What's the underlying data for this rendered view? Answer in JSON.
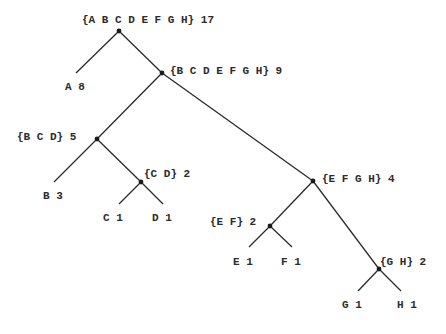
{
  "diagram": {
    "type": "huffman-tree",
    "nodes": [
      {
        "id": "ABCDEFGH",
        "label": "{A B C D E F G H} 17",
        "set": [
          "A",
          "B",
          "C",
          "D",
          "E",
          "F",
          "G",
          "H"
        ],
        "weight": 17,
        "x": 119,
        "y": 31,
        "lx": 82,
        "ly": 23,
        "dot": true
      },
      {
        "id": "A",
        "label": "A 8",
        "set": [
          "A"
        ],
        "weight": 8,
        "x": 76,
        "y": 73,
        "lx": 65,
        "ly": 90,
        "dot": false
      },
      {
        "id": "BCDEFGH",
        "label": "{B C D E F G H} 9",
        "set": [
          "B",
          "C",
          "D",
          "E",
          "F",
          "G",
          "H"
        ],
        "weight": 9,
        "x": 162,
        "y": 73,
        "lx": 170,
        "ly": 74,
        "dot": true
      },
      {
        "id": "BCD",
        "label": "{B C D} 5",
        "set": [
          "B",
          "C",
          "D"
        ],
        "weight": 5,
        "x": 97,
        "y": 139,
        "lx": 17,
        "ly": 140,
        "dot": true
      },
      {
        "id": "B",
        "label": "B 3",
        "set": [
          "B"
        ],
        "weight": 3,
        "x": 54,
        "y": 182,
        "lx": 43,
        "ly": 199,
        "dot": false
      },
      {
        "id": "CD",
        "label": "{C D} 2",
        "set": [
          "C",
          "D"
        ],
        "weight": 2,
        "x": 141,
        "y": 182,
        "lx": 144,
        "ly": 177,
        "dot": true
      },
      {
        "id": "C",
        "label": "C 1",
        "set": [
          "C"
        ],
        "weight": 1,
        "x": 119,
        "y": 204,
        "lx": 103,
        "ly": 221,
        "dot": false
      },
      {
        "id": "D",
        "label": "D 1",
        "set": [
          "D"
        ],
        "weight": 1,
        "x": 163,
        "y": 204,
        "lx": 152,
        "ly": 221,
        "dot": false
      },
      {
        "id": "EFGH",
        "label": "{E F G H} 4",
        "set": [
          "E",
          "F",
          "G",
          "H"
        ],
        "weight": 4,
        "x": 313,
        "y": 181,
        "lx": 322,
        "ly": 182,
        "dot": true
      },
      {
        "id": "EF",
        "label": "{E F} 2",
        "set": [
          "E",
          "F"
        ],
        "weight": 2,
        "x": 270,
        "y": 226,
        "lx": 210,
        "ly": 225,
        "dot": true
      },
      {
        "id": "E",
        "label": "E 1",
        "set": [
          "E"
        ],
        "weight": 1,
        "x": 249,
        "y": 247,
        "lx": 233,
        "ly": 265,
        "dot": false
      },
      {
        "id": "F",
        "label": "F 1",
        "set": [
          "F"
        ],
        "weight": 1,
        "x": 292,
        "y": 247,
        "lx": 281,
        "ly": 265,
        "dot": false
      },
      {
        "id": "GH",
        "label": "{G H} 2",
        "set": [
          "G",
          "H"
        ],
        "weight": 2,
        "x": 379,
        "y": 269,
        "lx": 380,
        "ly": 265,
        "dot": true
      },
      {
        "id": "G",
        "label": "G 1",
        "set": [
          "G"
        ],
        "weight": 1,
        "x": 358,
        "y": 291,
        "lx": 342,
        "ly": 308,
        "dot": false
      },
      {
        "id": "H",
        "label": "H 1",
        "set": [
          "H"
        ],
        "weight": 1,
        "x": 401,
        "y": 291,
        "lx": 397,
        "ly": 308,
        "dot": false
      }
    ],
    "edges": [
      {
        "from": "ABCDEFGH",
        "to": "A"
      },
      {
        "from": "ABCDEFGH",
        "to": "BCDEFGH"
      },
      {
        "from": "BCDEFGH",
        "to": "BCD"
      },
      {
        "from": "BCDEFGH",
        "to": "EFGH"
      },
      {
        "from": "BCD",
        "to": "B"
      },
      {
        "from": "BCD",
        "to": "CD"
      },
      {
        "from": "CD",
        "to": "C"
      },
      {
        "from": "CD",
        "to": "D"
      },
      {
        "from": "EFGH",
        "to": "EF"
      },
      {
        "from": "EFGH",
        "to": "GH"
      },
      {
        "from": "EF",
        "to": "E"
      },
      {
        "from": "EF",
        "to": "F"
      },
      {
        "from": "GH",
        "to": "G"
      },
      {
        "from": "GH",
        "to": "H"
      }
    ],
    "colors": {
      "background": "#ffffff",
      "line": "#2a2a2a",
      "text": "#2b2b2b"
    }
  }
}
